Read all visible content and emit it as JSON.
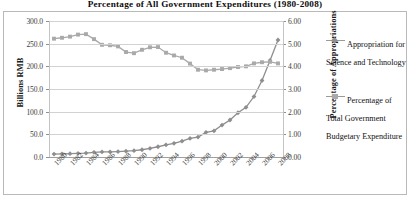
{
  "chart_data": {
    "type": "line",
    "title": "Percentage of All Government Expenditures (1980-2008)",
    "xlabel": "",
    "ylabel": "Billions RMB",
    "y2label": "Percentage of Appropriations",
    "ylim": [
      0,
      300
    ],
    "y2lim": [
      0,
      6
    ],
    "grid": true,
    "legend_position": "right",
    "x": [
      1980,
      1981,
      1982,
      1983,
      1984,
      1985,
      1986,
      1987,
      1988,
      1989,
      1990,
      1991,
      1992,
      1993,
      1994,
      1995,
      1996,
      1997,
      1998,
      1999,
      2000,
      2001,
      2002,
      2003,
      2004,
      2005,
      2006,
      2007,
      2008
    ],
    "xticklabels": [
      "1980",
      "1982",
      "1984",
      "1986",
      "1988",
      "1990",
      "1992",
      "1994",
      "1996",
      "1998",
      "2000",
      "2002",
      "2004",
      "2006",
      "2008"
    ],
    "yticklabels": [
      "0.0",
      "50.0",
      "100.0",
      "150.0",
      "200.0",
      "250.0",
      "300.0"
    ],
    "y2ticklabels": [
      "0.00",
      "1.00",
      "2.00",
      "3.00",
      "4.00",
      "5.00",
      "6.00"
    ],
    "series": [
      {
        "name": "Appropriation for Science and Technology",
        "axis": "left",
        "units": "Billions RMB",
        "color": "#8e8e8e",
        "marker": "diamond",
        "values": [
          6.4,
          6.9,
          7.4,
          7.9,
          8.6,
          10.3,
          11.3,
          11.4,
          12.0,
          12.8,
          13.9,
          16.0,
          18.9,
          22.6,
          26.8,
          30.2,
          34.9,
          40.9,
          43.9,
          54.4,
          57.6,
          70.4,
          81.6,
          97.6,
          109.5,
          133.4,
          168.8,
          213.0,
          258.1
        ]
      },
      {
        "name": "Percentage of Total Government Budgetary Expenditure",
        "axis": "right",
        "units": "Percent",
        "color": "#a9a9a9",
        "marker": "square",
        "values": [
          5.22,
          5.26,
          5.31,
          5.4,
          5.42,
          5.2,
          4.95,
          4.93,
          4.88,
          4.63,
          4.58,
          4.73,
          4.84,
          4.85,
          4.6,
          4.48,
          4.38,
          4.12,
          3.85,
          3.82,
          3.85,
          3.88,
          3.92,
          3.97,
          4.0,
          4.13,
          4.18,
          4.2,
          4.13
        ]
      }
    ]
  },
  "axes": {
    "left_title": "Billions RMB",
    "right_title": "Percentage of Appropriations"
  },
  "legend": {
    "items": [
      {
        "label": "Appropriation for Science and Technology",
        "marker": "diamond-line-marker"
      },
      {
        "label": "Percentage of Total Government Budgetary Expenditure",
        "marker": "square-line-marker"
      }
    ]
  }
}
